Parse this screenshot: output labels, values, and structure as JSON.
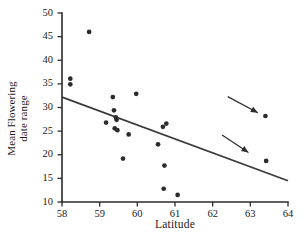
{
  "chart_data": {
    "type": "scatter",
    "title": "",
    "xlabel": "Latitude",
    "ylabel": "Mean Flowering\ndate range",
    "ylabel_line1": "Mean Flowering",
    "ylabel_line2": "date range",
    "xlim": [
      58,
      64
    ],
    "ylim": [
      10,
      50
    ],
    "xticks": [
      58,
      59,
      60,
      61,
      62,
      63,
      64
    ],
    "yticks": [
      10,
      15,
      20,
      25,
      30,
      35,
      40,
      45,
      50
    ],
    "grid": false,
    "legend": false,
    "marker": "filled-circle",
    "marker_color": "#2b2b2b",
    "line_color": "#3a3a3a",
    "points": [
      {
        "x": 58.22,
        "y": 36.1
      },
      {
        "x": 58.22,
        "y": 34.9
      },
      {
        "x": 58.72,
        "y": 46.0
      },
      {
        "x": 59.17,
        "y": 26.8
      },
      {
        "x": 59.35,
        "y": 32.2
      },
      {
        "x": 59.38,
        "y": 29.4
      },
      {
        "x": 59.4,
        "y": 25.6
      },
      {
        "x": 59.43,
        "y": 27.9
      },
      {
        "x": 59.45,
        "y": 27.4
      },
      {
        "x": 59.47,
        "y": 25.2
      },
      {
        "x": 59.62,
        "y": 19.2
      },
      {
        "x": 59.77,
        "y": 24.3
      },
      {
        "x": 59.97,
        "y": 32.9
      },
      {
        "x": 60.55,
        "y": 22.2
      },
      {
        "x": 60.68,
        "y": 25.9
      },
      {
        "x": 60.7,
        "y": 12.8
      },
      {
        "x": 60.72,
        "y": 17.7
      },
      {
        "x": 60.77,
        "y": 26.6
      },
      {
        "x": 61.07,
        "y": 11.5
      },
      {
        "x": 63.4,
        "y": 28.2
      },
      {
        "x": 63.42,
        "y": 18.7
      }
    ],
    "trend_line": {
      "x_start": 58.0,
      "y_start": 32.2,
      "x_end": 64.0,
      "y_end": 14.5
    },
    "annotations": [
      {
        "type": "arrow",
        "name": "arrow-upper-outlier",
        "tail_x": 62.4,
        "tail_y": 32.3,
        "head_x": 63.2,
        "head_y": 28.9
      },
      {
        "type": "arrow",
        "name": "arrow-lower-outlier",
        "tail_x": 62.25,
        "tail_y": 24.2,
        "head_x": 62.95,
        "head_y": 20.5
      }
    ]
  }
}
